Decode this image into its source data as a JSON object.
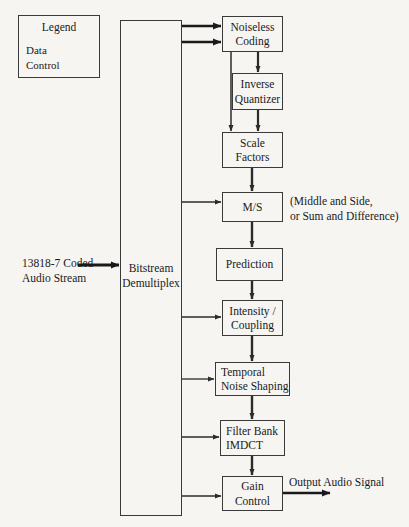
{
  "diagram": {
    "background_color": "#f6f5f2",
    "line_color": "#2b2b2b",
    "box_border_color": "#3a3a3a"
  },
  "legend": {
    "title": "Legend",
    "data_label": "Data",
    "control_label": "Control",
    "data_icon": "thick-arrow-right-icon",
    "control_icon": "thin-arrow-right-icon"
  },
  "input": {
    "stream_label_line1": "13818-7 Coded",
    "stream_label_line2": "Audio Stream",
    "arrow_icon": "thick-arrow-right-icon"
  },
  "output": {
    "label": "Output Audio Signal",
    "arrow_icon": "thick-arrow-right-icon"
  },
  "demux": {
    "line1": "Bitstream",
    "line2": "Demultiplex"
  },
  "blocks": [
    {
      "id": "noiseless-coding",
      "line1": "Noiseless",
      "line2": "Coding"
    },
    {
      "id": "inverse-quantizer",
      "line1": "Inverse",
      "line2": "Quantizer"
    },
    {
      "id": "scale-factors",
      "line1": "Scale",
      "line2": "Factors"
    },
    {
      "id": "ms",
      "line1": "M/S",
      "line2": ""
    },
    {
      "id": "prediction",
      "line1": "Prediction",
      "line2": ""
    },
    {
      "id": "intensity-coupling",
      "line1": "Intensity /",
      "line2": "Coupling"
    },
    {
      "id": "temporal-noise-shaping",
      "line1": "Temporal",
      "line2": "Noise Shaping"
    },
    {
      "id": "filter-bank-imdct",
      "line1": "Filter Bank",
      "line2": "IMDCT"
    },
    {
      "id": "gain-control",
      "line1": "Gain",
      "line2": "Control"
    }
  ],
  "annotations": {
    "ms_note_line1": "(Middle and Side,",
    "ms_note_line2": "or Sum and Difference)"
  }
}
